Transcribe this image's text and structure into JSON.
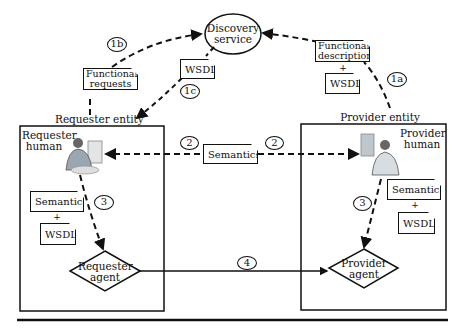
{
  "discovery": {
    "label_line1": "Discovery",
    "label_line2": "service"
  },
  "requester_entity": {
    "title": "Requester entity",
    "human_line1": "Requester",
    "human_line2": "human",
    "doc_semantics": "Semantics",
    "plus": "+",
    "doc_wsdl": "WSDL",
    "agent_line1": "Requester",
    "agent_line2": "agent"
  },
  "provider_entity": {
    "title": "Provider entity",
    "human_line1": "Provider",
    "human_line2": "human",
    "doc_semantics": "Semantics",
    "plus": "+",
    "doc_wsdl": "WSDL",
    "agent_line1": "Provider",
    "agent_line2": "agent"
  },
  "flows": {
    "functional_requests_line1": "Functional",
    "functional_requests_line2": "requests",
    "wsdl_1c": "WSDL",
    "functional_description_line1": "Functional",
    "functional_description_line2": "description",
    "plus_1a": "+",
    "wsdl_1a": "WSDL",
    "semantics_2": "Semantics"
  },
  "badges": {
    "b1a": "1a",
    "b1b": "1b",
    "b1c": "1c",
    "b2_left": "2",
    "b2_right": "2",
    "b3_left": "3",
    "b3_right": "3",
    "b4": "4"
  }
}
